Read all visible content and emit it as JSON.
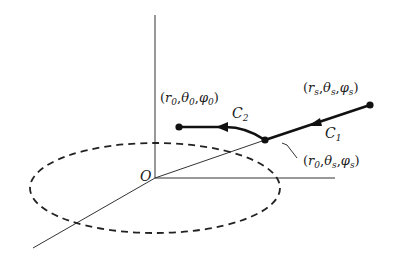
{
  "diagram": {
    "type": "3d-coordinate-path",
    "origin_label": "O",
    "points": {
      "start": {
        "label": "(r_s, θ_s, φ_s)",
        "r": "r",
        "r_sub": "s",
        "t": "θ",
        "t_sub": "s",
        "p": "φ",
        "p_sub": "s"
      },
      "corner": {
        "label": "(r_0, θ_s, φ_s)",
        "r": "r",
        "r_sub": "0",
        "t": "θ",
        "t_sub": "s",
        "p": "φ",
        "p_sub": "s"
      },
      "end": {
        "label": "(r_0, θ_0, φ_0)",
        "r": "r",
        "r_sub": "0",
        "t": "θ",
        "t_sub": "0",
        "p": "φ",
        "p_sub": "0"
      }
    },
    "curves": [
      {
        "name": "C",
        "sub": "1",
        "from": "start",
        "to": "corner"
      },
      {
        "name": "C",
        "sub": "2",
        "from": "corner",
        "to": "end"
      }
    ],
    "ellipse_style": "dashed",
    "colors": {
      "ink": "#1a1a1a",
      "background": "#ffffff"
    }
  }
}
